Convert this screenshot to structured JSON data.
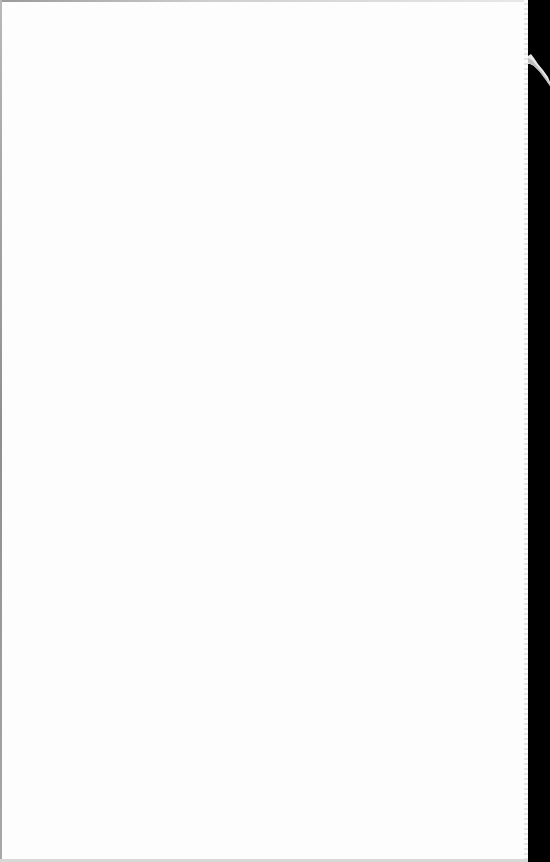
{
  "document": {
    "type": "scanned-page",
    "state": "blank",
    "text": ""
  },
  "colors": {
    "paper": "#fdfdfd",
    "scanner_background": "#000000",
    "paper_edge": "#9a9a9a"
  }
}
